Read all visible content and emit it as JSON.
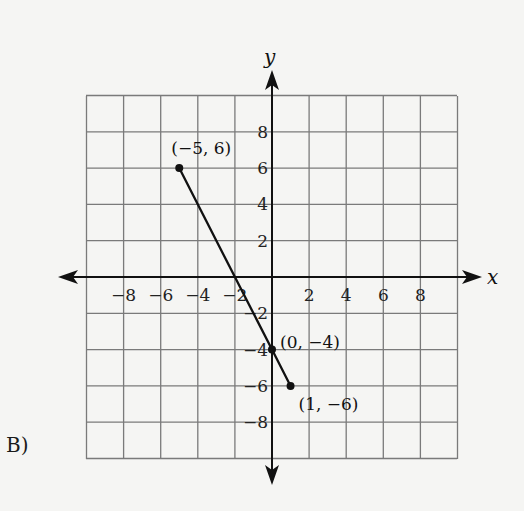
{
  "choice_label": "B)",
  "chart_data": {
    "type": "line",
    "title": "",
    "xlabel": "x",
    "ylabel": "y",
    "xlim": [
      -10,
      10
    ],
    "ylim": [
      -10,
      10
    ],
    "grid": true,
    "grid_step": 2,
    "x_ticks": [
      -8,
      -6,
      -4,
      -2,
      2,
      4,
      6,
      8
    ],
    "y_ticks": [
      8,
      6,
      4,
      2,
      -2,
      -4,
      -6,
      -8
    ],
    "x_tick_labels": [
      "−8",
      "−6",
      "−4",
      "−2",
      "2",
      "4",
      "6",
      "8"
    ],
    "y_tick_labels": [
      "8",
      "6",
      "4",
      "2",
      "−2",
      "−4",
      "−6",
      "−8"
    ],
    "series": [
      {
        "name": "segment",
        "points": [
          {
            "x": -5,
            "y": 6
          },
          {
            "x": 0,
            "y": -4
          },
          {
            "x": 1,
            "y": -6
          }
        ]
      }
    ],
    "annotations": [
      {
        "text": "(−5, 6)",
        "x": -5,
        "y": 6
      },
      {
        "text": "(0, −4)",
        "x": 0,
        "y": -4
      },
      {
        "text": "(1, −6)",
        "x": 1,
        "y": -6
      }
    ]
  }
}
